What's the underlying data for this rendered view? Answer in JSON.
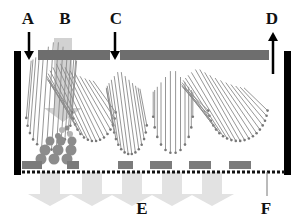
{
  "colors": {
    "wall": "#000000",
    "top_bar": "#6e6e6e",
    "column": "#d2d2d2",
    "pad": "#7b7b7b",
    "fiber": "#8a8a8a",
    "fiber_dot": "#777777",
    "particle": "#8c8c8c",
    "particle_light": "#b4b4b4",
    "flow_arrow": "#e2e2e2",
    "dots": "#111111"
  },
  "labels": {
    "A": {
      "text": "A",
      "x": 28,
      "y": 24
    },
    "B": {
      "text": "B",
      "x": 65,
      "y": 24
    },
    "C": {
      "text": "C",
      "x": 116,
      "y": 24
    },
    "D": {
      "text": "D",
      "x": 272,
      "y": 24
    },
    "E": {
      "text": "E",
      "x": 142,
      "y": 214
    },
    "F": {
      "text": "F",
      "x": 266,
      "y": 214
    }
  },
  "walls": [
    {
      "x": 14,
      "y": 51,
      "w": 7,
      "h": 124
    },
    {
      "x": 284,
      "y": 51,
      "w": 7,
      "h": 124
    }
  ],
  "top_bars": [
    {
      "x": 38,
      "y": 50,
      "w": 72,
      "h": 10
    },
    {
      "x": 120,
      "y": 50,
      "w": 149,
      "h": 10
    }
  ],
  "column": {
    "x": 54,
    "y": 38,
    "w": 18,
    "h": 70
  },
  "arrows_down": [
    {
      "name": "arrow-a",
      "x": 29,
      "y1": 32,
      "y2": 60
    },
    {
      "name": "arrow-c",
      "x": 115,
      "y1": 32,
      "y2": 60
    }
  ],
  "arrow_up": {
    "name": "arrow-d",
    "x": 273,
    "y1": 74,
    "y2": 32
  },
  "pads": [
    {
      "x": 22,
      "y": 161,
      "w": 20,
      "h": 8
    },
    {
      "x": 67,
      "y": 161,
      "w": 12,
      "h": 8
    },
    {
      "x": 118,
      "y": 161,
      "w": 15,
      "h": 8
    },
    {
      "x": 150,
      "y": 161,
      "w": 22,
      "h": 8
    },
    {
      "x": 189,
      "y": 161,
      "w": 22,
      "h": 8
    },
    {
      "x": 229,
      "y": 161,
      "w": 22,
      "h": 8
    }
  ],
  "dotted_line": {
    "x1": 22,
    "x2": 284,
    "y": 172,
    "step": 5
  },
  "f_pointer": {
    "x": 267,
    "y1": 172,
    "y2": 196
  },
  "flow_arrows": [
    {
      "x": 40
    },
    {
      "x": 82
    },
    {
      "x": 122
    },
    {
      "x": 162
    },
    {
      "x": 202
    }
  ],
  "fiber_groups": [
    {
      "name": "group-1",
      "cx": 49,
      "cy": 112,
      "rx": 23,
      "ry": 42,
      "count": 14,
      "tilt": -4,
      "from": 40,
      "to": 126
    },
    {
      "name": "group-2",
      "cx": 94,
      "cy": 107,
      "rx": 22,
      "ry": 38,
      "count": 16,
      "tilt": 30,
      "from": 62,
      "to": 122
    },
    {
      "name": "group-3",
      "cx": 130,
      "cy": 120,
      "rx": 17,
      "ry": 38,
      "count": 14,
      "tilt": 8,
      "from": 70,
      "to": 155
    },
    {
      "name": "group-4",
      "cx": 173,
      "cy": 110,
      "rx": 20,
      "ry": 48,
      "count": 12,
      "tilt": 0,
      "from": 68,
      "to": 160
    },
    {
      "name": "group-5",
      "cx": 238,
      "cy": 105,
      "rx": 30,
      "ry": 40,
      "count": 20,
      "tilt": 38,
      "from": 68,
      "to": 150
    }
  ],
  "particles": [
    {
      "cx": 62,
      "cy": 130,
      "r": 3,
      "light": true
    },
    {
      "cx": 70,
      "cy": 134,
      "r": 3,
      "light": true
    },
    {
      "cx": 58,
      "cy": 136,
      "r": 3,
      "light": false
    },
    {
      "cx": 67,
      "cy": 128,
      "r": 2.5,
      "light": false
    },
    {
      "cx": 50,
      "cy": 141,
      "r": 4.5,
      "light": false
    },
    {
      "cx": 61,
      "cy": 141,
      "r": 4.5,
      "light": false
    },
    {
      "cx": 72,
      "cy": 141,
      "r": 4.5,
      "light": false
    },
    {
      "cx": 45,
      "cy": 150,
      "r": 5.5,
      "light": false
    },
    {
      "cx": 58,
      "cy": 150,
      "r": 5.5,
      "light": false
    },
    {
      "cx": 71,
      "cy": 150,
      "r": 5.5,
      "light": false
    },
    {
      "cx": 41,
      "cy": 159,
      "r": 5.5,
      "light": false
    },
    {
      "cx": 54,
      "cy": 159,
      "r": 5.5,
      "light": false
    },
    {
      "cx": 67,
      "cy": 159,
      "r": 5.5,
      "light": false
    }
  ]
}
